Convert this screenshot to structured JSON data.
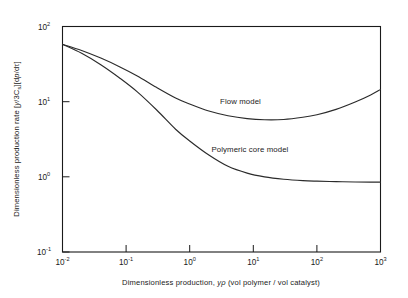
{
  "chart_data": {
    "type": "line",
    "title": "",
    "xlabel": "Dimensionless production, yρ (vol polymer / vol catalyst)",
    "ylabel": "Dimensionless production rate [(y/3Cₛ)(dp/dτ)]",
    "xscale": "log",
    "yscale": "log",
    "xlim": [
      0.01,
      1000
    ],
    "ylim": [
      0.1,
      100
    ],
    "grid": false,
    "legend_position": "inline-annotation",
    "xticks": [
      {
        "value": 0.01,
        "mantissa": "10",
        "exponent": "-2"
      },
      {
        "value": 0.1,
        "mantissa": "10",
        "exponent": "-1"
      },
      {
        "value": 1,
        "mantissa": "10",
        "exponent": "0"
      },
      {
        "value": 10,
        "mantissa": "10",
        "exponent": "1"
      },
      {
        "value": 100,
        "mantissa": "10",
        "exponent": "2"
      },
      {
        "value": 1000,
        "mantissa": "10",
        "exponent": "3"
      }
    ],
    "yticks": [
      {
        "value": 0.1,
        "mantissa": "10",
        "exponent": "-1"
      },
      {
        "value": 1,
        "mantissa": "10",
        "exponent": "0"
      },
      {
        "value": 10,
        "mantissa": "10",
        "exponent": "1"
      },
      {
        "value": 100,
        "mantissa": "10",
        "exponent": "2"
      }
    ],
    "series": [
      {
        "name": "Flow model",
        "label": "Flow model",
        "label_x": 3.0,
        "label_y": 9.2,
        "x": [
          0.01,
          0.02,
          0.04,
          0.08,
          0.15,
          0.3,
          0.6,
          1.0,
          2.0,
          4.0,
          8.0,
          15.0,
          30.0,
          60.0,
          100.0,
          200.0,
          400.0,
          700.0,
          1000.0
        ],
        "y": [
          58.0,
          48.0,
          38.0,
          29.0,
          22.0,
          15.5,
          11.2,
          9.3,
          7.5,
          6.5,
          5.95,
          5.75,
          5.8,
          6.2,
          6.7,
          7.9,
          9.9,
          12.3,
          14.5
        ]
      },
      {
        "name": "Polymeric core model",
        "label": "Polymeric core model",
        "label_x": 2.2,
        "label_y": 2.15,
        "x": [
          0.01,
          0.02,
          0.04,
          0.08,
          0.15,
          0.3,
          0.6,
          1.0,
          2.0,
          4.0,
          8.0,
          15.0,
          30.0,
          60.0,
          100.0,
          200.0,
          400.0,
          700.0,
          1000.0
        ],
        "y": [
          58.0,
          44.0,
          31.0,
          20.5,
          13.5,
          7.8,
          4.3,
          3.0,
          1.95,
          1.38,
          1.12,
          1.0,
          0.93,
          0.89,
          0.875,
          0.862,
          0.855,
          0.852,
          0.85
        ]
      }
    ]
  },
  "axis_titles": {
    "x_parts": {
      "lead": "Dimensionless production, ",
      "symbol": "yρ",
      "trail": " (vol polymer / vol catalyst)"
    },
    "y_parts": {
      "lead": "Dimensionless production rate [",
      "gamma": "y",
      "slash": "/3C",
      "sub": "s",
      "bracket_mid": "][d",
      "p": "p",
      "over": "/d",
      "tau": "τ",
      "close": "]"
    }
  }
}
